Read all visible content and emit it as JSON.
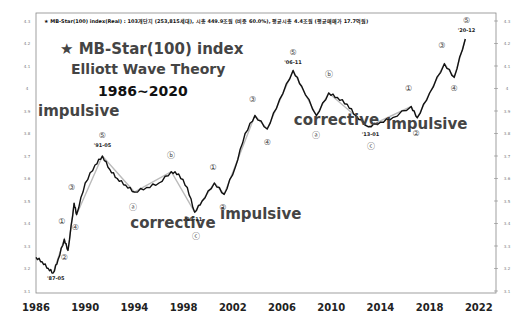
{
  "chart_data": {
    "type": "line",
    "title": "★ MB-Star(100) index Elliott Wave Theory 1986~2020",
    "title_lines": [
      "★ MB-Star(100) index",
      "Elliott Wave Theory",
      "1986~2020"
    ],
    "header": "★ MB-Star(100) index(Real) : 103개단지 (253,815세대),  시총 449.9조원 (비중 60.0%),  평균시총 4.4조원 (평균매매가 17.7억원)",
    "xlabel": "",
    "ylabel": "",
    "x_ticks": [
      "1986",
      "1990",
      "1994",
      "1998",
      "2002",
      "2006",
      "2010",
      "2014",
      "2018",
      "2022"
    ],
    "y_ticks": [
      "3.1",
      "3.2",
      "3.3",
      "3.4",
      "3.5",
      "3.6",
      "3.7",
      "3.8",
      "3.9",
      "4",
      "4.1",
      "4.2",
      "4.3"
    ],
    "xlim": [
      1986,
      2022
    ],
    "ylim": [
      3.1,
      4.3
    ],
    "grid": false,
    "series": [
      {
        "name": "MB-Star(100) index (log)",
        "x": [
          1986.0,
          1986.5,
          1987.0,
          1987.4,
          1987.8,
          1988.3,
          1988.6,
          1989.1,
          1989.3,
          1990.0,
          1990.8,
          1991.4,
          1992.0,
          1992.6,
          1993.3,
          1994.0,
          1995.0,
          1996.0,
          1997.0,
          1997.6,
          1998.3,
          1998.9,
          1999.5,
          2000.5,
          2001.3,
          2002.2,
          2003.0,
          2003.8,
          2004.8,
          2005.8,
          2006.9,
          2007.6,
          2008.8,
          2009.8,
          2010.5,
          2011.3,
          2012.0,
          2013.0,
          2014.0,
          2015.0,
          2016.5,
          2017.0,
          2018.0,
          2019.2,
          2020.0,
          2020.9
        ],
        "values": [
          3.25,
          3.23,
          3.2,
          3.18,
          3.24,
          3.33,
          3.28,
          3.49,
          3.44,
          3.58,
          3.66,
          3.7,
          3.64,
          3.6,
          3.57,
          3.54,
          3.56,
          3.58,
          3.63,
          3.62,
          3.56,
          3.45,
          3.5,
          3.58,
          3.53,
          3.65,
          3.8,
          3.88,
          3.82,
          3.95,
          4.08,
          4.01,
          3.88,
          3.98,
          3.96,
          3.93,
          3.88,
          3.83,
          3.85,
          3.87,
          3.92,
          3.87,
          3.98,
          4.11,
          4.05,
          4.22
        ]
      }
    ],
    "annotations": {
      "phases": [
        {
          "label": "impulsive",
          "x": 1986,
          "y": 3.88
        },
        {
          "label": "corrective",
          "x": 1993.5,
          "y": 3.38
        },
        {
          "label": "impulsive",
          "x": 2000.8,
          "y": 3.42
        },
        {
          "label": "corrective",
          "x": 2006.8,
          "y": 3.84
        },
        {
          "label": "impulsive",
          "x": 2014.3,
          "y": 3.82
        }
      ],
      "waves": [
        {
          "label": "①",
          "x": 1988.1,
          "y": 3.4
        },
        {
          "label": "②",
          "x": 1988.3,
          "y": 3.24
        },
        {
          "label": "③",
          "x": 1988.9,
          "y": 3.55
        },
        {
          "label": "④",
          "x": 1989.2,
          "y": 3.37
        },
        {
          "label": "⑤",
          "x": 1991.4,
          "y": 3.78
        },
        {
          "label": "ⓐ",
          "x": 1993.9,
          "y": 3.46
        },
        {
          "label": "ⓑ",
          "x": 1997.0,
          "y": 3.69
        },
        {
          "label": "ⓒ",
          "x": 1999.0,
          "y": 3.33
        },
        {
          "label": "①",
          "x": 2000.4,
          "y": 3.64
        },
        {
          "label": "②",
          "x": 2001.2,
          "y": 3.46
        },
        {
          "label": "③",
          "x": 2003.6,
          "y": 3.94
        },
        {
          "label": "④",
          "x": 2004.8,
          "y": 3.75
        },
        {
          "label": "⑤",
          "x": 2006.9,
          "y": 4.15
        },
        {
          "label": "ⓑ",
          "x": 2009.8,
          "y": 4.05
        },
        {
          "label": "ⓐ",
          "x": 2008.8,
          "y": 3.78
        },
        {
          "label": "ⓒ",
          "x": 2013.2,
          "y": 3.73
        },
        {
          "label": "①",
          "x": 2016.3,
          "y": 3.99
        },
        {
          "label": "②",
          "x": 2016.9,
          "y": 3.79
        },
        {
          "label": "③",
          "x": 2019.0,
          "y": 4.18
        },
        {
          "label": "④",
          "x": 2020.0,
          "y": 3.99
        },
        {
          "label": "⑤",
          "x": 2021.0,
          "y": 4.29
        }
      ],
      "dates": [
        {
          "label": "'87-05",
          "x": 1987.6,
          "y": 3.15
        },
        {
          "label": "'91-05",
          "x": 1991.4,
          "y": 3.74
        },
        {
          "label": "'98-11",
          "x": 1998.8,
          "y": 3.41
        },
        {
          "label": "'06-11",
          "x": 2006.9,
          "y": 4.11
        },
        {
          "label": "'13-01",
          "x": 2013.2,
          "y": 3.79
        },
        {
          "label": "'20-12",
          "x": 2021.0,
          "y": 4.25
        }
      ]
    }
  }
}
